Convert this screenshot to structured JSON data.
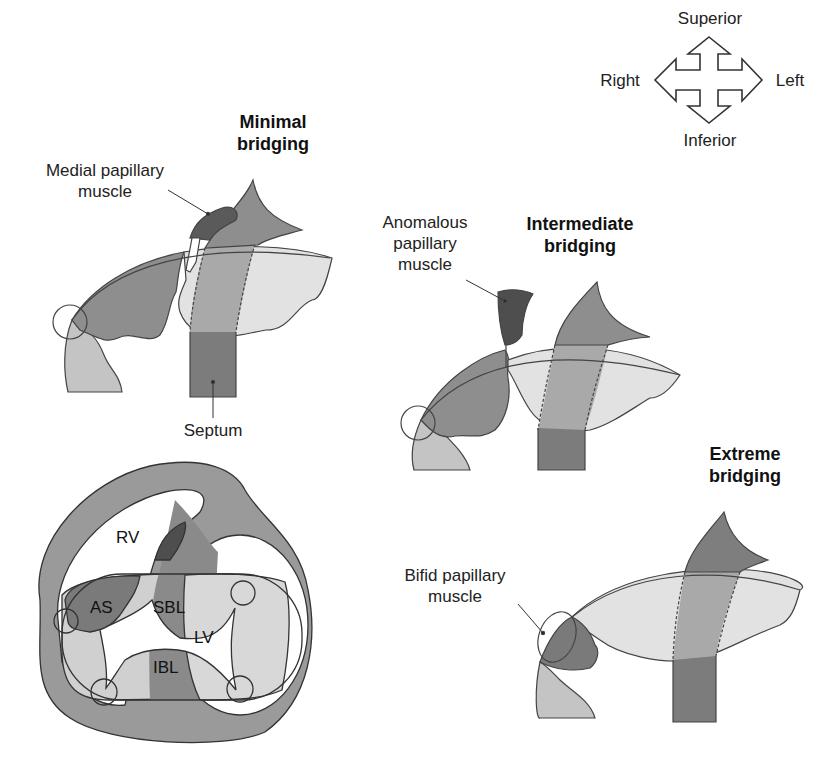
{
  "orientation": {
    "superior": "Superior",
    "inferior": "Inferior",
    "right": "Right",
    "left": "Left"
  },
  "panels": {
    "minimal": {
      "title_line1": "Minimal",
      "title_line2": "bridging",
      "label_muscle_line1": "Medial papillary",
      "label_muscle_line2": "muscle",
      "label_septum": "Septum"
    },
    "intermediate": {
      "title_line1": "Intermediate",
      "title_line2": "bridging",
      "label_muscle_line1": "Anomalous",
      "label_muscle_line2": "papillary",
      "label_muscle_line3": "muscle"
    },
    "extreme": {
      "title_line1": "Extreme",
      "title_line2": "bridging",
      "label_muscle_line1": "Bifid papillary",
      "label_muscle_line2": "muscle"
    },
    "cross_section": {
      "rv": "RV",
      "lv": "LV",
      "as": "AS",
      "sbl": "SBL",
      "ibl": "IBL"
    }
  },
  "colors": {
    "dark": "#5a5a5a",
    "mid": "#8e8e8e",
    "light": "#bdbdbd",
    "pale": "#e2e2e2",
    "outline": "#333333"
  }
}
